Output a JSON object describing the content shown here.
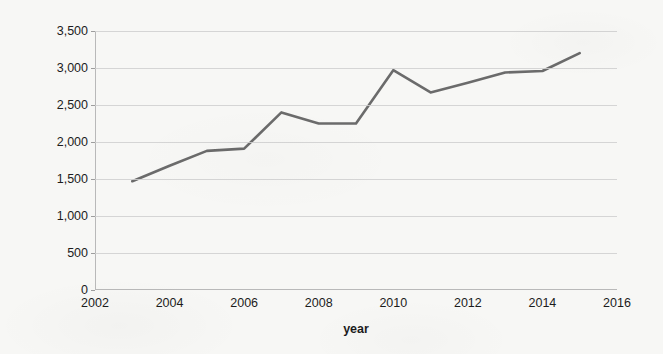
{
  "chart_data": {
    "type": "line",
    "title": "",
    "xlabel": "year",
    "ylabel": "Cases where elderly people died alone",
    "xlim": [
      2002,
      2016
    ],
    "ylim": [
      0,
      3500
    ],
    "grid": true,
    "legend": false,
    "line_color": "#6b6b6b",
    "x": [
      2003,
      2004,
      2005,
      2006,
      2007,
      2008,
      2009,
      2010,
      2011,
      2012,
      2013,
      2014,
      2015
    ],
    "values": [
      1470,
      1680,
      1880,
      1910,
      2400,
      2250,
      2250,
      2970,
      2670,
      2800,
      2940,
      2960,
      3200
    ],
    "series": [
      {
        "name": "Cases where elderly people died alone",
        "values": [
          1470,
          1680,
          1880,
          1910,
          2400,
          2250,
          2250,
          2970,
          2670,
          2800,
          2940,
          2960,
          3200
        ]
      }
    ],
    "x_tick_values": [
      2002,
      2004,
      2006,
      2008,
      2010,
      2012,
      2014,
      2016
    ],
    "x_tick_labels": [
      "2002",
      "2004",
      "2006",
      "2008",
      "2010",
      "2012",
      "2014",
      "2016"
    ],
    "y_tick_values": [
      0,
      500,
      1000,
      1500,
      2000,
      2500,
      3000,
      3500
    ],
    "y_tick_labels": [
      "0",
      "500",
      "1,000",
      "1,500",
      "2,000",
      "2,500",
      "3,000",
      "3,500"
    ]
  }
}
